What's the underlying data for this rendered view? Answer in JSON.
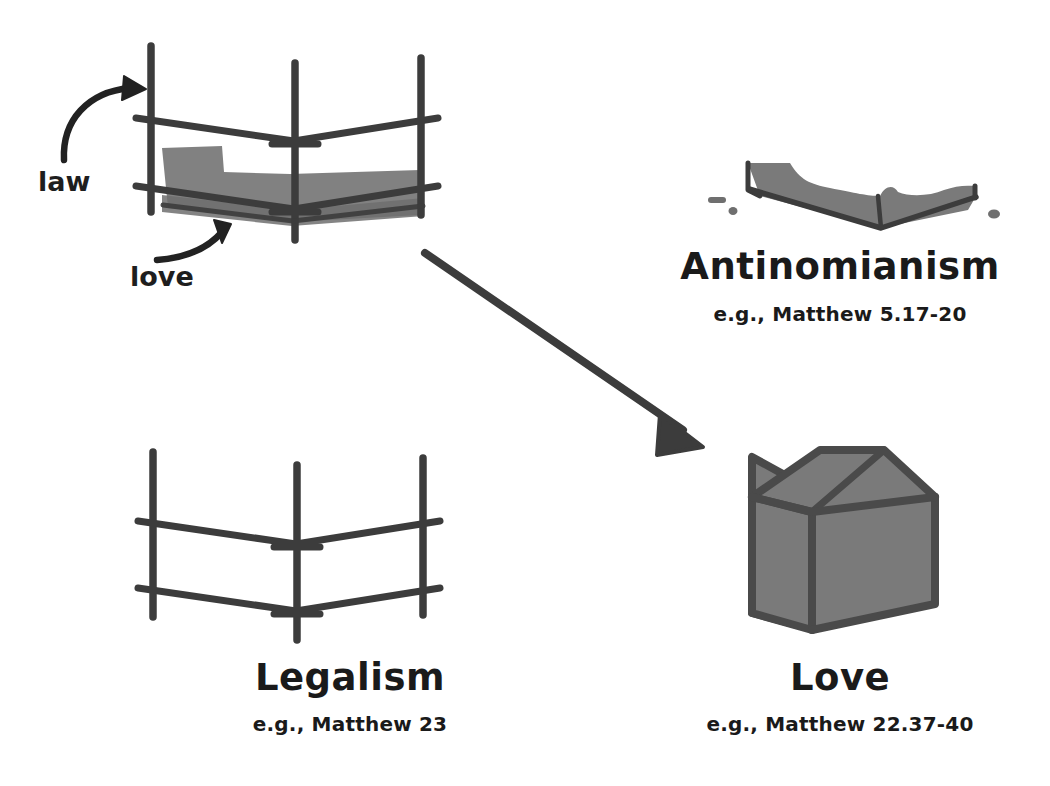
{
  "canvas": {
    "width": 1050,
    "height": 786,
    "background": "#ffffff"
  },
  "palette": {
    "ink": "#3c3c3c",
    "ink_dark": "#333333",
    "fill_gray": "#7a7a7a",
    "background": "#ffffff"
  },
  "annotations": {
    "law_label": "law",
    "love_label": "love"
  },
  "panels": [
    {
      "id": "law-love-scaffold",
      "position": "top-left",
      "title": "",
      "caption": "",
      "icon": "scaffold-with-low-fill"
    },
    {
      "id": "antinomianism",
      "position": "top-right",
      "title": "Antinomianism",
      "caption": "e.g., Matthew 5.17-20",
      "icon": "spilled-puddle-shape"
    },
    {
      "id": "legalism",
      "position": "bottom-left",
      "title": "Legalism",
      "caption": "e.g., Matthew 23",
      "icon": "empty-scaffold"
    },
    {
      "id": "love",
      "position": "bottom-right",
      "title": "Love",
      "caption": "e.g., Matthew 22.37-40",
      "icon": "filled-tent-house"
    }
  ],
  "arrow": {
    "name": "transformation-arrow",
    "from": "law-love-scaffold",
    "to": "love"
  }
}
